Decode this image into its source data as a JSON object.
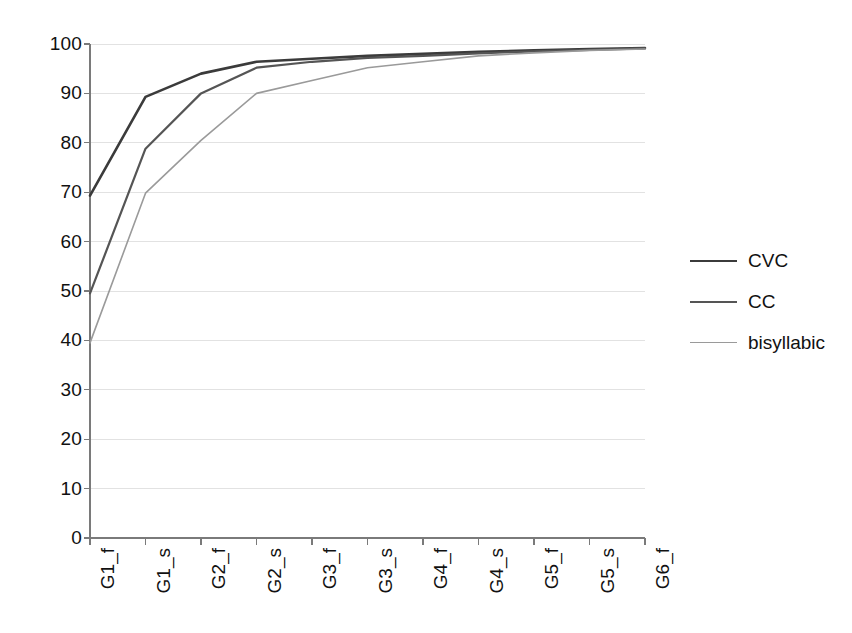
{
  "chart_data": {
    "type": "line",
    "title": "",
    "subtitle": "",
    "xlabel": "",
    "ylabel": "",
    "categories": [
      "G1_f",
      "G1_s",
      "G2_f",
      "G2_s",
      "G3_f",
      "G3_s",
      "G4_f",
      "G4_s",
      "G5_f",
      "G5_s",
      "G6_f"
    ],
    "ylim": [
      0,
      100
    ],
    "yticks": [
      0,
      10,
      20,
      30,
      40,
      50,
      60,
      70,
      80,
      90,
      100
    ],
    "grid": true,
    "grid_axis": "y",
    "legend_position": "right",
    "series": [
      {
        "name": "CVC",
        "color": "#3b3b3b",
        "width": 2.6,
        "values": [
          69.3,
          89.3,
          94,
          96.4,
          97,
          97.6,
          98,
          98.4,
          98.7,
          99,
          99.2
        ]
      },
      {
        "name": "CC",
        "color": "#555555",
        "width": 2.2,
        "values": [
          49.5,
          78.8,
          90,
          95.2,
          96.4,
          97.2,
          97.6,
          98.1,
          98.5,
          98.8,
          99.1
        ]
      },
      {
        "name": "bisyllabic",
        "color": "#9a9a9a",
        "width": 1.6,
        "values": [
          39.5,
          69.8,
          80.5,
          90,
          92.6,
          95.2,
          96.4,
          97.6,
          98.2,
          98.7,
          99
        ]
      }
    ]
  },
  "axes": {
    "y_tick_labels": [
      "100",
      "90",
      "80",
      "70",
      "60",
      "50",
      "40",
      "30",
      "20",
      "10",
      "0"
    ],
    "x_tick_labels": [
      "G1_f",
      "G1_s",
      "G2_f",
      "G2_s",
      "G3_f",
      "G3_s",
      "G4_f",
      "G4_s",
      "G5_f",
      "G5_s",
      "G6_f"
    ]
  },
  "legend": {
    "entries": [
      {
        "label": "CVC"
      },
      {
        "label": "CC"
      },
      {
        "label": "bisyllabic"
      }
    ]
  },
  "style": {
    "background": "#ffffff",
    "axis_color": "#7a7a7a",
    "grid_color": "#e2e2e2",
    "text_color": "#111111"
  }
}
